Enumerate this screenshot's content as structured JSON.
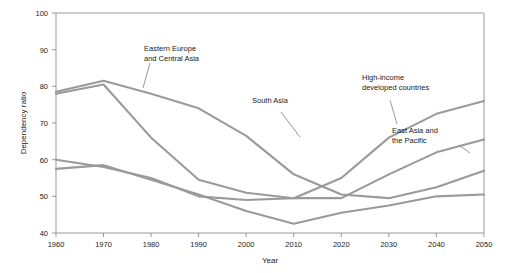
{
  "chart_data": {
    "type": "line",
    "title": "",
    "xlabel": "Year",
    "ylabel": "Dependency ratio",
    "x": [
      1960,
      1970,
      1980,
      1990,
      2000,
      2010,
      2020,
      2030,
      2040,
      2050
    ],
    "xlim": [
      1960,
      2050
    ],
    "ylim": [
      40,
      100
    ],
    "xticks": [
      "1960",
      "1970",
      "1980",
      "1990",
      "2000",
      "2010",
      "2020",
      "2030",
      "2040",
      "2050"
    ],
    "yticks": [
      "40",
      "50",
      "60",
      "70",
      "80",
      "90",
      "100"
    ],
    "grid": false,
    "legend": "annotations-on-plot",
    "series": [
      {
        "name": "South Asia",
        "color": "#9a9a9a",
        "values": [
          78.5,
          81.5,
          78.0,
          74.0,
          66.5,
          56.0,
          50.5,
          49.5,
          52.5,
          57.0
        ]
      },
      {
        "name": "Eastern Europe and Central Asia",
        "color": "#9a9a9a",
        "values": [
          78.0,
          80.5,
          66.0,
          54.5,
          51.0,
          49.5,
          49.5,
          56.0,
          62.0,
          65.5
        ]
      },
      {
        "name": "High-income developed countries",
        "color": "#9a9a9a",
        "values": [
          60.0,
          58.0,
          55.0,
          50.0,
          49.0,
          49.5,
          55.0,
          66.0,
          72.5,
          76.0
        ]
      },
      {
        "name": "East Asia and the Pacific",
        "color": "#9a9a9a",
        "values": [
          57.5,
          58.5,
          54.5,
          50.5,
          46.0,
          42.5,
          45.5,
          47.5,
          50.0,
          50.5
        ]
      }
    ],
    "annotations": [
      {
        "id": "eastern-europe-label",
        "lines": [
          "Eastern Europe",
          "and Central Asia"
        ],
        "x": 144,
        "y": 51
      },
      {
        "id": "south-asia-label",
        "lines": [
          "South Asia"
        ],
        "x": 252,
        "y": 103
      },
      {
        "id": "high-income-label",
        "lines": [
          "High-income",
          "developed countries"
        ],
        "x": 362,
        "y": 80
      },
      {
        "id": "east-asia-label",
        "lines": [
          "East Asia and",
          "the Pacific"
        ],
        "x": 392,
        "y": 133
      }
    ]
  },
  "axes": {
    "y_title": "Dependency ratio",
    "x_title": "Year"
  }
}
